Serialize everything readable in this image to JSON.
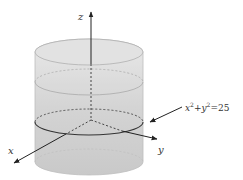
{
  "figure": {
    "type": "3d-cylinder-diagram",
    "axes": {
      "x_label": "x",
      "y_label": "y",
      "z_label": "z"
    },
    "equation": {
      "lhs_x": "x",
      "lhs_y": "y",
      "exp": "2",
      "plus": "+",
      "rhs": "=25",
      "full": "x²+y²=25"
    },
    "colors": {
      "cylinder_fill": "#d6d6d6",
      "cylinder_edge": "#b0b0b0",
      "axis": "#333333",
      "circle": "#444444"
    }
  }
}
